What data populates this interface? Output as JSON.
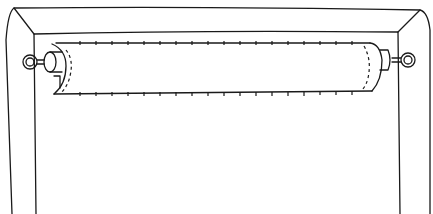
{
  "illustration": {
    "subject": "rolled-up-shade-on-rod-in-window-frame",
    "colors": {
      "background": "#ffffff",
      "ink": "#1a1a1a"
    }
  }
}
